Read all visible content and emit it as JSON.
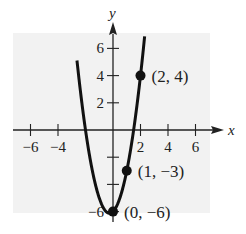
{
  "chart_data": {
    "type": "line",
    "title": "",
    "xlabel": "x",
    "ylabel": "y",
    "xlim": [
      -7,
      7
    ],
    "ylim": [
      -6.5,
      7
    ],
    "x_ticks": [
      -6,
      -4,
      2,
      4,
      6
    ],
    "x_tick_labels": [
      "−6",
      "−4",
      "2",
      "4",
      "6"
    ],
    "y_ticks": [
      6,
      4,
      2,
      -2,
      -4,
      -6
    ],
    "y_tick_labels": [
      "6",
      "4",
      "2",
      "",
      "",
      "−6"
    ],
    "grid": false,
    "background": "#f2f2f2",
    "series": [
      {
        "name": "y = 2x² + x − 6",
        "equation": "y = 2x^2 + x - 6",
        "x": [
          -2.5,
          -2,
          -1.5,
          -1,
          -0.5,
          -0.25,
          0,
          0.5,
          1,
          1.5,
          2,
          2.3
        ],
        "values": [
          4,
          0,
          -3,
          -5,
          -6,
          -6.125,
          -6,
          -5,
          -3,
          0,
          4,
          6.88
        ]
      }
    ],
    "points": [
      {
        "x": 2,
        "y": 4,
        "label": "(2, 4)"
      },
      {
        "x": 1,
        "y": -3,
        "label": "(1, −3)"
      },
      {
        "x": 0,
        "y": -6,
        "label": "(0, −6)"
      }
    ]
  }
}
